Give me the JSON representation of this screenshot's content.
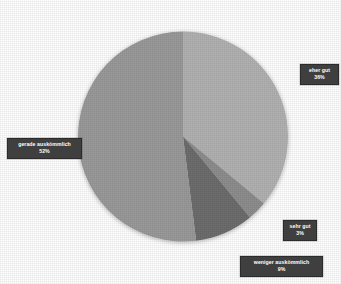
{
  "chart_data": {
    "type": "pie",
    "title": "",
    "subtitle": "",
    "xlabel": "",
    "ylabel": "",
    "legend_position": "none",
    "grid": false,
    "labels_as_callouts": true,
    "start_angle_deg": 0,
    "direction": "clockwise",
    "categories": [
      "eher gut",
      "sehr gut",
      "weniger auskömmlich",
      "gerade auskömmlich"
    ],
    "values": [
      36,
      3,
      9,
      52
    ],
    "value_suffix": "%",
    "slices": [
      {
        "label": "eher gut",
        "value": 36,
        "value_text": "36%",
        "color": "#b3b3b3"
      },
      {
        "label": "sehr gut",
        "value": 3,
        "value_text": "3%",
        "color": "#8f8f8f"
      },
      {
        "label": "weniger auskömmlich",
        "value": 9,
        "value_text": "9%",
        "color": "#6e6e6e"
      },
      {
        "label": "gerade auskömmlich",
        "value": 52,
        "value_text": "52%",
        "color": "#9b9b9b"
      }
    ]
  },
  "callouts": {
    "eher_gut": {
      "category": "eher gut",
      "value_text": "36%"
    },
    "gerade_auskoemmlich": {
      "category": "gerade auskömmlich",
      "value_text": "52%"
    },
    "sehr_gut": {
      "category": "sehr gut",
      "value_text": "3%"
    },
    "weniger_auskoemmlich": {
      "category": "weniger auskömmlich",
      "value_text": "9%"
    }
  },
  "colors": {
    "background": "#ffffff",
    "callout_background": "#3f3f3f",
    "callout_text": "#ffffff",
    "slice_light": "#b3b3b3",
    "slice_medium": "#9b9b9b",
    "slice_dark_medium": "#8f8f8f",
    "slice_dark": "#6e6e6e"
  }
}
